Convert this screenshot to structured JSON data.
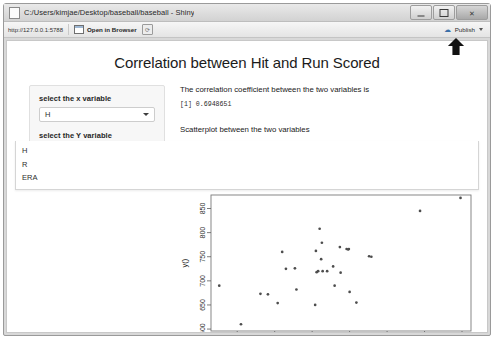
{
  "window": {
    "title": "C:/Users/kimjae/Desktop/baseball/baseball - Shiny",
    "app_icon": "shiny-app-icon",
    "minimize_label": "",
    "maximize_label": "",
    "close_label": "✕"
  },
  "toolbar": {
    "url": "http://127.0.0.1:5788",
    "open_in_browser_label": "Open in Browser",
    "refresh_icon": "refresh-icon",
    "publish_icon": "publish-icon",
    "publish_label": "Publish",
    "publish_caret": "chevron-down-icon"
  },
  "page": {
    "title": "Correlation between Hit and Run Scored"
  },
  "sidebar": {
    "x_label": "select the x variable",
    "x_value": "H",
    "y_label": "select the Y variable",
    "y_value": "R",
    "dropdown_open": true,
    "dropdown_options": [
      "H",
      "R",
      "ERA"
    ]
  },
  "main": {
    "correlation_text": "The correlation coefficient between the two variables is",
    "correlation_value": "[1] 0.6948651",
    "scatter_caption": "Scatterplot between the two variables"
  },
  "chart_data": {
    "type": "scatter",
    "title": "",
    "xlabel": "x()",
    "ylabel": "y()",
    "xlim": [
      1265,
      1612
    ],
    "ylim": [
      596,
      878
    ],
    "xticks": [
      1300,
      1350,
      1400,
      1450,
      1500,
      1550,
      1600
    ],
    "yticks": [
      600,
      650,
      700,
      750,
      800,
      850
    ],
    "grid": false,
    "legend": null,
    "point_color": "#4d4d4d",
    "series": [
      {
        "name": "teams",
        "x": [
          1276,
          1305,
          1331,
          1341,
          1354,
          1360,
          1365,
          1377,
          1379,
          1404,
          1405,
          1406,
          1408,
          1410,
          1412,
          1413,
          1414,
          1420,
          1428,
          1430,
          1437,
          1438,
          1446,
          1448,
          1449,
          1450,
          1459,
          1476,
          1479,
          1544,
          1598
        ],
        "y": [
          690,
          610,
          673,
          672,
          654,
          760,
          725,
          726,
          682,
          650,
          762,
          718,
          720,
          808,
          745,
          779,
          720,
          720,
          730,
          690,
          770,
          717,
          766,
          765,
          766,
          677,
          655,
          751,
          750,
          845,
          872
        ]
      }
    ]
  }
}
